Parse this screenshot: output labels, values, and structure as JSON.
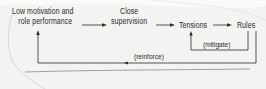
{
  "diagram": {
    "nodes": [
      {
        "id": "low-motivation",
        "lines": [
          "Low motivation and",
          "role performance"
        ]
      },
      {
        "id": "close-supervision",
        "lines": [
          "Close",
          "supervision"
        ]
      },
      {
        "id": "tensions",
        "lines": [
          "Tensions"
        ]
      },
      {
        "id": "rules",
        "lines": [
          "Rules"
        ]
      }
    ],
    "edges": [
      {
        "from": "low-motivation",
        "to": "close-supervision",
        "label": ""
      },
      {
        "from": "close-supervision",
        "to": "tensions",
        "label": ""
      },
      {
        "from": "tensions",
        "to": "rules",
        "label": ""
      },
      {
        "from": "rules",
        "to": "tensions",
        "label": "(mitigate)"
      },
      {
        "from": "rules",
        "to": "low-motivation",
        "label": "(reinforce)"
      }
    ],
    "colors": {
      "ink": "#2a2a2a",
      "paper": "#f3f3f1",
      "edge": "#b8b8b8"
    }
  }
}
